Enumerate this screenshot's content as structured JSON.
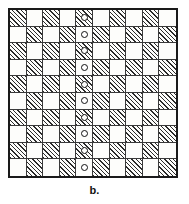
{
  "figure": {
    "caption": "b.",
    "type": "checkerboard-grid-diagram",
    "rows": 10,
    "columns": 10,
    "marker_glyph": "o",
    "marker_column_index": 4,
    "colors": {
      "hatch_line": "#2b2b2b",
      "cell_background": "#fdfdfb",
      "grid_line": "#3a3a3a",
      "outer_border": "#1a1a1a",
      "caption_text": "#111111",
      "page_background": "#ffffff"
    },
    "legend": {
      "hatched_meaning": "shaded square",
      "plain_meaning": "unshaded square",
      "marker_meaning": "circle marker"
    }
  },
  "grid": {
    "cells": [
      [
        {
          "shaded": true,
          "marker": false
        },
        {
          "shaded": false,
          "marker": false
        },
        {
          "shaded": true,
          "marker": false
        },
        {
          "shaded": false,
          "marker": false
        },
        {
          "shaded": true,
          "marker": true
        },
        {
          "shaded": false,
          "marker": false
        },
        {
          "shaded": true,
          "marker": false
        },
        {
          "shaded": false,
          "marker": false
        },
        {
          "shaded": true,
          "marker": false
        },
        {
          "shaded": false,
          "marker": false
        }
      ],
      [
        {
          "shaded": false,
          "marker": false
        },
        {
          "shaded": true,
          "marker": false
        },
        {
          "shaded": false,
          "marker": false
        },
        {
          "shaded": true,
          "marker": false
        },
        {
          "shaded": false,
          "marker": true
        },
        {
          "shaded": true,
          "marker": false
        },
        {
          "shaded": false,
          "marker": false
        },
        {
          "shaded": true,
          "marker": false
        },
        {
          "shaded": false,
          "marker": false
        },
        {
          "shaded": true,
          "marker": false
        }
      ],
      [
        {
          "shaded": true,
          "marker": false
        },
        {
          "shaded": false,
          "marker": false
        },
        {
          "shaded": true,
          "marker": false
        },
        {
          "shaded": false,
          "marker": false
        },
        {
          "shaded": true,
          "marker": true
        },
        {
          "shaded": false,
          "marker": false
        },
        {
          "shaded": true,
          "marker": false
        },
        {
          "shaded": false,
          "marker": false
        },
        {
          "shaded": true,
          "marker": false
        },
        {
          "shaded": false,
          "marker": false
        }
      ],
      [
        {
          "shaded": false,
          "marker": false
        },
        {
          "shaded": true,
          "marker": false
        },
        {
          "shaded": false,
          "marker": false
        },
        {
          "shaded": true,
          "marker": false
        },
        {
          "shaded": false,
          "marker": true
        },
        {
          "shaded": true,
          "marker": false
        },
        {
          "shaded": false,
          "marker": false
        },
        {
          "shaded": true,
          "marker": false
        },
        {
          "shaded": false,
          "marker": false
        },
        {
          "shaded": true,
          "marker": false
        }
      ],
      [
        {
          "shaded": true,
          "marker": false
        },
        {
          "shaded": false,
          "marker": false
        },
        {
          "shaded": true,
          "marker": false
        },
        {
          "shaded": false,
          "marker": false
        },
        {
          "shaded": true,
          "marker": true
        },
        {
          "shaded": false,
          "marker": false
        },
        {
          "shaded": true,
          "marker": false
        },
        {
          "shaded": false,
          "marker": false
        },
        {
          "shaded": true,
          "marker": false
        },
        {
          "shaded": false,
          "marker": false
        }
      ],
      [
        {
          "shaded": false,
          "marker": false
        },
        {
          "shaded": true,
          "marker": false
        },
        {
          "shaded": false,
          "marker": false
        },
        {
          "shaded": true,
          "marker": false
        },
        {
          "shaded": false,
          "marker": true
        },
        {
          "shaded": true,
          "marker": false
        },
        {
          "shaded": false,
          "marker": false
        },
        {
          "shaded": true,
          "marker": false
        },
        {
          "shaded": false,
          "marker": false
        },
        {
          "shaded": true,
          "marker": false
        }
      ],
      [
        {
          "shaded": true,
          "marker": false
        },
        {
          "shaded": false,
          "marker": false
        },
        {
          "shaded": true,
          "marker": false
        },
        {
          "shaded": false,
          "marker": false
        },
        {
          "shaded": true,
          "marker": true
        },
        {
          "shaded": false,
          "marker": false
        },
        {
          "shaded": true,
          "marker": false
        },
        {
          "shaded": false,
          "marker": false
        },
        {
          "shaded": true,
          "marker": false
        },
        {
          "shaded": false,
          "marker": false
        }
      ],
      [
        {
          "shaded": false,
          "marker": false
        },
        {
          "shaded": true,
          "marker": false
        },
        {
          "shaded": false,
          "marker": false
        },
        {
          "shaded": true,
          "marker": false
        },
        {
          "shaded": false,
          "marker": true
        },
        {
          "shaded": true,
          "marker": false
        },
        {
          "shaded": false,
          "marker": false
        },
        {
          "shaded": true,
          "marker": false
        },
        {
          "shaded": false,
          "marker": false
        },
        {
          "shaded": true,
          "marker": false
        }
      ],
      [
        {
          "shaded": true,
          "marker": false
        },
        {
          "shaded": false,
          "marker": false
        },
        {
          "shaded": true,
          "marker": false
        },
        {
          "shaded": false,
          "marker": false
        },
        {
          "shaded": true,
          "marker": true
        },
        {
          "shaded": false,
          "marker": false
        },
        {
          "shaded": true,
          "marker": false
        },
        {
          "shaded": false,
          "marker": false
        },
        {
          "shaded": true,
          "marker": false
        },
        {
          "shaded": false,
          "marker": false
        }
      ],
      [
        {
          "shaded": false,
          "marker": false
        },
        {
          "shaded": true,
          "marker": false
        },
        {
          "shaded": false,
          "marker": false
        },
        {
          "shaded": true,
          "marker": false
        },
        {
          "shaded": false,
          "marker": true
        },
        {
          "shaded": true,
          "marker": false
        },
        {
          "shaded": false,
          "marker": false
        },
        {
          "shaded": true,
          "marker": false
        },
        {
          "shaded": false,
          "marker": false
        },
        {
          "shaded": true,
          "marker": false
        }
      ]
    ]
  }
}
